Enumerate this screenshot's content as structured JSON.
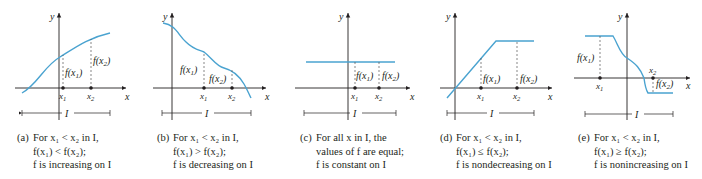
{
  "figure": {
    "colors": {
      "curve": "#4aa3d0",
      "axis": "#231f20",
      "dashed": "#555555"
    },
    "axis_labels": {
      "x": "x",
      "y": "y",
      "interval": "I"
    },
    "point_labels": {
      "x1": "x",
      "x1_sub": "1",
      "x2": "x",
      "x2_sub": "2"
    },
    "function_labels": {
      "fx1": "f(x",
      "fx1_sub": "1",
      "fx2": "f(x",
      "fx2_sub": "2",
      "close": ")"
    },
    "panels": [
      {
        "id": "a",
        "caption": [
          "(a)",
          "For x₁ < x₂ in I,",
          "f(x₁) < f(x₂);",
          "f is increasing on I"
        ]
      },
      {
        "id": "b",
        "caption": [
          "(b)",
          "For x₁ < x₂ in I,",
          "f(x₁) > f(x₂);",
          "f is decreasing on I"
        ]
      },
      {
        "id": "c",
        "caption": [
          "(c)",
          "For all x in I, the",
          "values of f are equal;",
          "f is constant on I"
        ]
      },
      {
        "id": "d",
        "caption": [
          "(d)",
          "For x₁ < x₂ in I,",
          "f(x₁) ≤ f(x₂);",
          "f is nondecreasing on I"
        ]
      },
      {
        "id": "e",
        "caption": [
          "(e)",
          "For x₁ < x₂ in I,",
          "f(x₁) ≥ f(x₂);",
          "f is nonincreasing on I"
        ]
      }
    ]
  }
}
